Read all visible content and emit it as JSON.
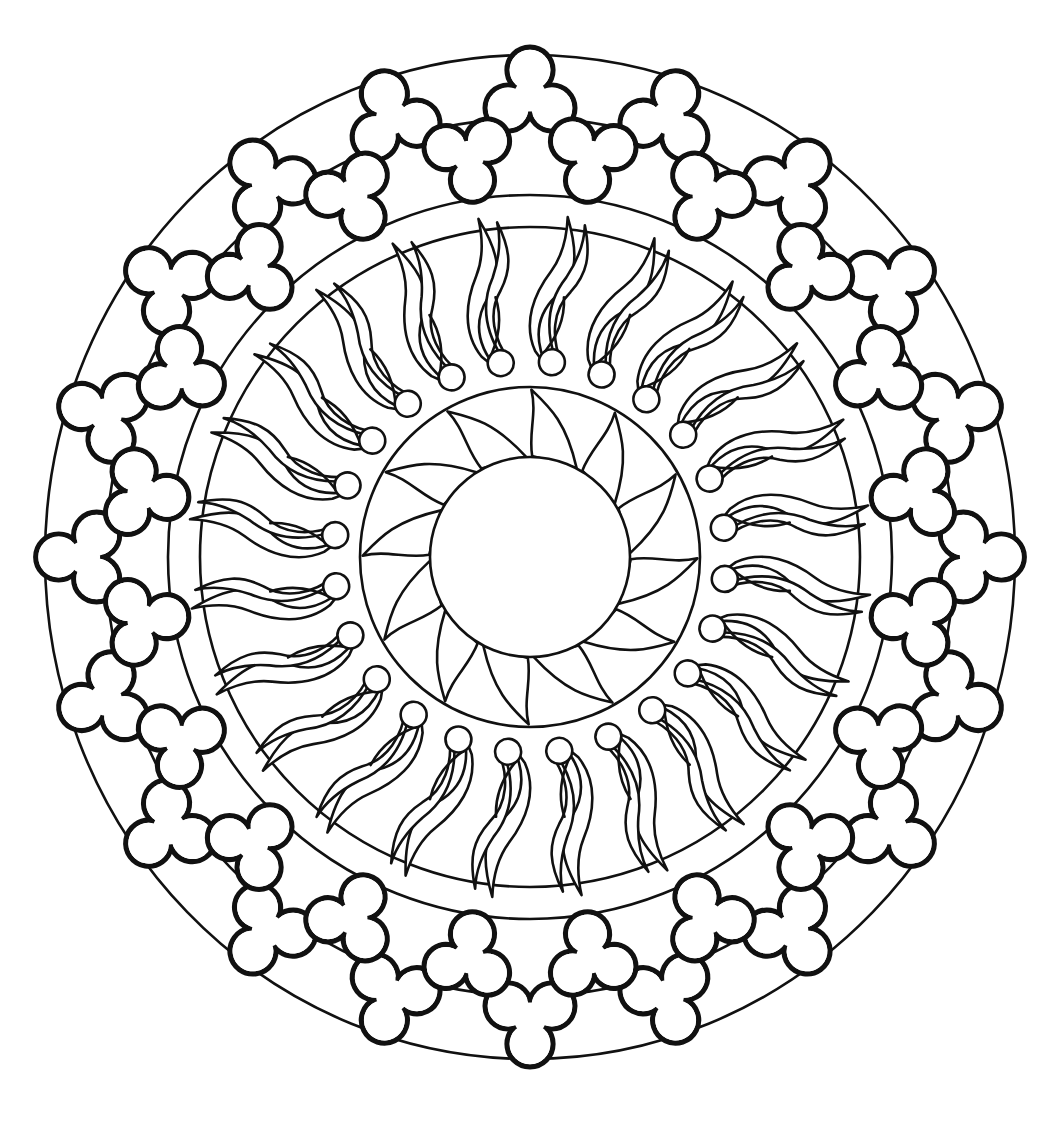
{
  "image": {
    "kind": "mandala coloring page",
    "background": "#ffffff",
    "line_color": "#111111"
  },
  "mandala": {
    "center": [
      530,
      557
    ],
    "outer_ring": {
      "rx": 485,
      "ry": 502
    },
    "clover_band_inner": {
      "rx": 362,
      "ry": 362
    },
    "flame_band_outer": {
      "rx": 330,
      "ry": 330
    },
    "petal_ring": {
      "r": 170
    },
    "center_disc": {
      "r": 100
    },
    "clovers": {
      "outer_count": 20,
      "inner_count": 20
    },
    "flames": {
      "count": 24
    },
    "petals": {
      "count": 12
    }
  }
}
